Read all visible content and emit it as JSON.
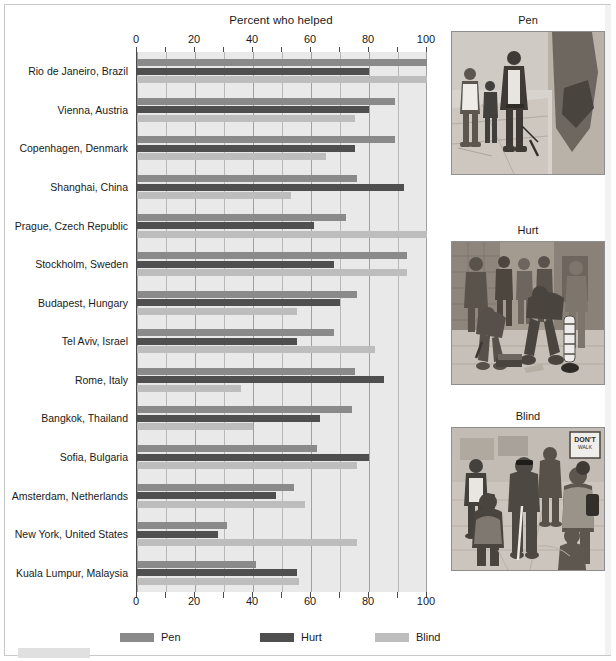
{
  "chart_data": {
    "type": "bar",
    "orientation": "horizontal",
    "title": "Percent who helped",
    "xlabel": "",
    "ylabel": "",
    "xlim": [
      0,
      100
    ],
    "xticks": [
      0,
      20,
      40,
      60,
      80,
      100
    ],
    "minor_tick_step": 10,
    "grid": true,
    "legend_position": "bottom",
    "categories": [
      "Rio de Janeiro, Brazil",
      "Vienna, Austria",
      "Copenhagen, Denmark",
      "Shanghai, China",
      "Prague, Czech Republic",
      "Stockholm, Sweden",
      "Budapest, Hungary",
      "Tel Aviv, Israel",
      "Rome, Italy",
      "Bangkok, Thailand",
      "Sofia, Bulgaria",
      "Amsterdam, Netherlands",
      "New York, United States",
      "Kuala Lumpur, Malaysia"
    ],
    "series": [
      {
        "name": "Pen",
        "color": "#8a8a8a",
        "values": [
          100,
          89,
          89,
          76,
          72,
          93,
          76,
          68,
          75,
          74,
          62,
          54,
          31,
          41
        ]
      },
      {
        "name": "Hurt",
        "color": "#4f4f4f",
        "values": [
          80,
          80,
          75,
          92,
          61,
          68,
          70,
          55,
          85,
          63,
          80,
          48,
          28,
          55
        ]
      },
      {
        "name": "Blind",
        "color": "#bdbdbd",
        "values": [
          100,
          75,
          65,
          53,
          100,
          93,
          55,
          82,
          36,
          40,
          76,
          58,
          76,
          56
        ]
      }
    ]
  },
  "chart": {
    "title": "Percent who helped",
    "tick_labels": [
      "0",
      "20",
      "40",
      "60",
      "80",
      "100"
    ],
    "legend": [
      {
        "label": "Pen",
        "color": "#8a8a8a"
      },
      {
        "label": "Hurt",
        "color": "#4f4f4f"
      },
      {
        "label": "Blind",
        "color": "#bdbdbd"
      }
    ]
  },
  "panels": [
    {
      "title": "Pen",
      "scene": "pedestrian-dropping-pen-on-sidewalk"
    },
    {
      "title": "Hurt",
      "scene": "person-with-leg-brace-dropping-magazines"
    },
    {
      "title": "Blind",
      "scene": "blind-man-with-cane-at-crosswalk"
    }
  ]
}
